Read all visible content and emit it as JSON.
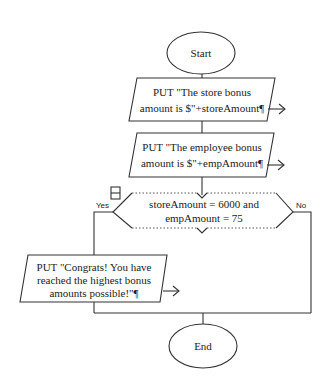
{
  "flowchart": {
    "start": {
      "label": "Start"
    },
    "output1": {
      "line1": "PUT \"The store bonus",
      "line2": "amount is $\"+storeAmount¶"
    },
    "output2": {
      "line1": "PUT \"The employee bonus",
      "line2": "amount is $\"+empAmount¶"
    },
    "decision": {
      "line1": "storeAmount = 6000 and",
      "line2": "empAmount = 75",
      "yes_label": "Yes",
      "no_label": "No"
    },
    "output3": {
      "line1": "PUT \"Congrats!  You have",
      "line2": "reached the highest bonus",
      "line3": "amounts possible!\"¶"
    },
    "end": {
      "label": "End"
    }
  },
  "colors": {
    "stroke": "#333333",
    "background": "#ffffff",
    "text": "#222222"
  }
}
